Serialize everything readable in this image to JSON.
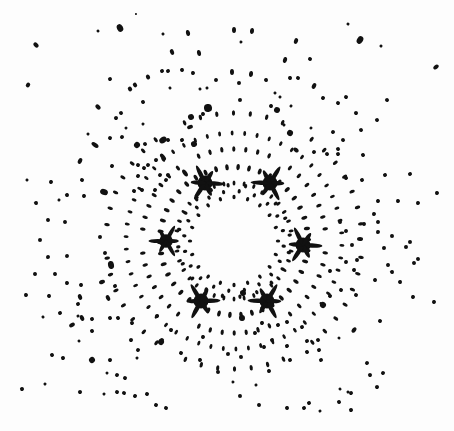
{
  "image": {
    "subject": "X-ray Laue diffraction pattern",
    "width": 454,
    "height": 431,
    "background": "#fdfdfd",
    "spot_color": "#111111",
    "center": [
      234,
      241
    ],
    "symmetry": 6
  },
  "stars": [
    {
      "x": 205,
      "y": 183,
      "r": 10
    },
    {
      "x": 270,
      "y": 183,
      "r": 10
    },
    {
      "x": 166,
      "y": 241,
      "r": 9
    },
    {
      "x": 303,
      "y": 245,
      "r": 10
    },
    {
      "x": 201,
      "y": 301,
      "r": 10
    },
    {
      "x": 267,
      "y": 301,
      "r": 10
    }
  ],
  "spots": [
    [
      120,
      28,
      3,
      4
    ],
    [
      136,
      14,
      1,
      1
    ],
    [
      98,
      31,
      1.5,
      1.5
    ],
    [
      36,
      45,
      2,
      3
    ],
    [
      28,
      85,
      2.5,
      2
    ],
    [
      188,
      33,
      2,
      3
    ],
    [
      163,
      34,
      1.5,
      1.5
    ],
    [
      172,
      52,
      2,
      3
    ],
    [
      199,
      53,
      2,
      3
    ],
    [
      162,
      71,
      2,
      2
    ],
    [
      168,
      71,
      2,
      2
    ],
    [
      182,
      70,
      2,
      2
    ],
    [
      193,
      73,
      2,
      2
    ],
    [
      148,
      77,
      2,
      2.5
    ],
    [
      110,
      79,
      2,
      2
    ],
    [
      130,
      89,
      2,
      2.5
    ],
    [
      135,
      85,
      2,
      2.5
    ],
    [
      216,
      80,
      2,
      2
    ],
    [
      170,
      88,
      1.5,
      1.5
    ],
    [
      200,
      89,
      1.5,
      1.5
    ],
    [
      207,
      88,
      1.5,
      1.5
    ],
    [
      98,
      107,
      2,
      3
    ],
    [
      143,
      102,
      2,
      2
    ],
    [
      121,
      113,
      2,
      2
    ],
    [
      116,
      118,
      2,
      2
    ],
    [
      126,
      128,
      1.5,
      1.5
    ],
    [
      143,
      124,
      1.5,
      1.5
    ],
    [
      190,
      127,
      3,
      2
    ],
    [
      208,
      108,
      4,
      4
    ],
    [
      203,
      114,
      2,
      2
    ],
    [
      191,
      117,
      3,
      3
    ],
    [
      88,
      134,
      1.5,
      1.5
    ],
    [
      110,
      138,
      2,
      2
    ],
    [
      95,
      145,
      2,
      4
    ],
    [
      122,
      137,
      2,
      2
    ],
    [
      137,
      145,
      3,
      3
    ],
    [
      145,
      144,
      2,
      2
    ],
    [
      163,
      140,
      4,
      3
    ],
    [
      168,
      140,
      2,
      2
    ],
    [
      182,
      140,
      2,
      2
    ],
    [
      194,
      144,
      3,
      3
    ],
    [
      80,
      161,
      3,
      2
    ],
    [
      112,
      166,
      2,
      2
    ],
    [
      148,
      165,
      2,
      2
    ],
    [
      138,
      165,
      2,
      2
    ],
    [
      156,
      160,
      2,
      2
    ],
    [
      163,
      157,
      2,
      4
    ],
    [
      27,
      180,
      1.5,
      1.5
    ],
    [
      51,
      182,
      2,
      2
    ],
    [
      82,
      180,
      2,
      2
    ],
    [
      104,
      192,
      3,
      4
    ],
    [
      138,
      176,
      2,
      2
    ],
    [
      144,
      168,
      2,
      2
    ],
    [
      160,
      175,
      2,
      2
    ],
    [
      168,
      175,
      2,
      2
    ],
    [
      185,
      173,
      2,
      4
    ],
    [
      36,
      203,
      2,
      2
    ],
    [
      59,
      200,
      1.5,
      1.5
    ],
    [
      67,
      195,
      2,
      2
    ],
    [
      84,
      196,
      2,
      2
    ],
    [
      134,
      191,
      2,
      2
    ],
    [
      142,
      190,
      2,
      2
    ],
    [
      155,
      190,
      2,
      2
    ],
    [
      166,
      180,
      2,
      2
    ],
    [
      234,
      30,
      2,
      3
    ],
    [
      252,
      31,
      2,
      3
    ],
    [
      241,
      42,
      1.5,
      1.5
    ],
    [
      296,
      41,
      2,
      3
    ],
    [
      348,
      24,
      1.5,
      1.5
    ],
    [
      360,
      40,
      3,
      4
    ],
    [
      381,
      46,
      1.5,
      1.5
    ],
    [
      436,
      67,
      2,
      3
    ],
    [
      285,
      60,
      2,
      3
    ],
    [
      310,
      59,
      2,
      2
    ],
    [
      232,
      72,
      2,
      3
    ],
    [
      251,
      74,
      2,
      3
    ],
    [
      266,
      80,
      2,
      2
    ],
    [
      290,
      78,
      2,
      2
    ],
    [
      298,
      78,
      2,
      2
    ],
    [
      314,
      86,
      2,
      3
    ],
    [
      323,
      98,
      2,
      2
    ],
    [
      346,
      97,
      2,
      2
    ],
    [
      338,
      103,
      2,
      2
    ],
    [
      387,
      100,
      2,
      2
    ],
    [
      356,
      113,
      2,
      2
    ],
    [
      377,
      120,
      2,
      2
    ],
    [
      239,
      83,
      2,
      2
    ],
    [
      275,
      93,
      1.5,
      1.5
    ],
    [
      280,
      97,
      1.5,
      1.5
    ],
    [
      240,
      100,
      2,
      2
    ],
    [
      271,
      106,
      2,
      2
    ],
    [
      277,
      110,
      3,
      3
    ],
    [
      291,
      106,
      1.5,
      1.5
    ],
    [
      284,
      125,
      1.5,
      1.5
    ],
    [
      290,
      133,
      3,
      3
    ],
    [
      311,
      128,
      1.5,
      1.5
    ],
    [
      333,
      132,
      2,
      2
    ],
    [
      343,
      140,
      2,
      2
    ],
    [
      338,
      149,
      2,
      2
    ],
    [
      361,
      130,
      2,
      2
    ],
    [
      363,
      155,
      2,
      2
    ],
    [
      385,
      175,
      2,
      2
    ],
    [
      410,
      174,
      2,
      2
    ],
    [
      437,
      193,
      2,
      2
    ],
    [
      296,
      150,
      3,
      2
    ],
    [
      314,
      152,
      2,
      2
    ],
    [
      327,
      154,
      2,
      2
    ],
    [
      338,
      154,
      2,
      2
    ],
    [
      346,
      178,
      2,
      2
    ],
    [
      362,
      180,
      2,
      2
    ],
    [
      378,
      201,
      2,
      2
    ],
    [
      398,
      201,
      2,
      2
    ],
    [
      418,
      203,
      2,
      2
    ],
    [
      48,
      220,
      2,
      2
    ],
    [
      65,
      222,
      2,
      2
    ],
    [
      40,
      240,
      2,
      2
    ],
    [
      48,
      257,
      2,
      2
    ],
    [
      67,
      256,
      2,
      2
    ],
    [
      35,
      274,
      2,
      2
    ],
    [
      55,
      274,
      2,
      2
    ],
    [
      67,
      283,
      2,
      2
    ],
    [
      81,
      285,
      2,
      2
    ],
    [
      26,
      295,
      2,
      2
    ],
    [
      49,
      296,
      2,
      2
    ],
    [
      80,
      297,
      3,
      2
    ],
    [
      108,
      298,
      3,
      2
    ],
    [
      115,
      286,
      2,
      2
    ],
    [
      111,
      265,
      4,
      3
    ],
    [
      102,
      282,
      2,
      3
    ],
    [
      100,
      237,
      2,
      2
    ],
    [
      105,
      253,
      2,
      2
    ],
    [
      78,
      304,
      2,
      2
    ],
    [
      60,
      313,
      2,
      2
    ],
    [
      82,
      318,
      3,
      2
    ],
    [
      110,
      318,
      2,
      2
    ],
    [
      118,
      318,
      2,
      2
    ],
    [
      43,
      317,
      1.5,
      1.5
    ],
    [
      79,
      341,
      1.5,
      1.5
    ],
    [
      78,
      316,
      1.5,
      1.5
    ],
    [
      92,
      319,
      2,
      2
    ],
    [
      92,
      331,
      2,
      2
    ],
    [
      72,
      325,
      2,
      3
    ],
    [
      92,
      360,
      3,
      3
    ],
    [
      63,
      358,
      2,
      2
    ],
    [
      45,
      384,
      1.5,
      1.5
    ],
    [
      52,
      355,
      2,
      2
    ],
    [
      22,
      389,
      2,
      2
    ],
    [
      80,
      392,
      2,
      2
    ],
    [
      104,
      394,
      1.5,
      1.5
    ],
    [
      107,
      373,
      1.5,
      1.5
    ],
    [
      117,
      375,
      2,
      2
    ],
    [
      110,
      360,
      2,
      2
    ],
    [
      125,
      378,
      2,
      2
    ],
    [
      117,
      392,
      2,
      2
    ],
    [
      124,
      393,
      2,
      2
    ],
    [
      135,
      396,
      2,
      2
    ],
    [
      147,
      394,
      2,
      2
    ],
    [
      156,
      405,
      2,
      2
    ],
    [
      166,
      408,
      2,
      2
    ],
    [
      137,
      358,
      1.5,
      1.5
    ],
    [
      131,
      340,
      2,
      2
    ],
    [
      138,
      350,
      2,
      2
    ],
    [
      132,
      323,
      2,
      2
    ],
    [
      162,
      340,
      2,
      2
    ],
    [
      171,
      330,
      2,
      2
    ],
    [
      157,
      316,
      2,
      2
    ],
    [
      161,
      342,
      3,
      3
    ],
    [
      181,
      353,
      2,
      2
    ],
    [
      200,
      360,
      2,
      2
    ],
    [
      203,
      337,
      2,
      2
    ],
    [
      218,
      372,
      2,
      2
    ],
    [
      228,
      354,
      2,
      2
    ],
    [
      233,
      382,
      1.5,
      1.5
    ],
    [
      240,
      396,
      2,
      2
    ],
    [
      256,
      385,
      1.5,
      1.5
    ],
    [
      259,
      405,
      2,
      2
    ],
    [
      287,
      408,
      2,
      2
    ],
    [
      304,
      408,
      2,
      2
    ],
    [
      309,
      403,
      2,
      2
    ],
    [
      320,
      411,
      1.5,
      1.5
    ],
    [
      351,
      410,
      2,
      2
    ],
    [
      377,
      387,
      2,
      2
    ],
    [
      339,
      402,
      2,
      2
    ],
    [
      351,
      393,
      2,
      2
    ],
    [
      383,
      373,
      2,
      2
    ],
    [
      348,
      392,
      1.5,
      1.5
    ],
    [
      370,
      375,
      2,
      2
    ],
    [
      367,
      363,
      2,
      2
    ],
    [
      340,
      389,
      1.5,
      1.5
    ],
    [
      321,
      360,
      2,
      2
    ],
    [
      319,
      350,
      2,
      2
    ],
    [
      307,
      352,
      2,
      2
    ],
    [
      307,
      341,
      2,
      2
    ],
    [
      290,
      360,
      2,
      2
    ],
    [
      269,
      371,
      2,
      2
    ],
    [
      287,
      346,
      2,
      2
    ],
    [
      272,
      340,
      2,
      2
    ],
    [
      264,
      347,
      2,
      2
    ],
    [
      255,
      333,
      2,
      2
    ],
    [
      241,
      357,
      2,
      2
    ],
    [
      242,
      318,
      3,
      3
    ],
    [
      243,
      293,
      3,
      3
    ],
    [
      262,
      323,
      2,
      2
    ],
    [
      278,
      325,
      2,
      2
    ],
    [
      287,
      322,
      2,
      2
    ],
    [
      302,
      327,
      2,
      2
    ],
    [
      318,
      340,
      2,
      2
    ],
    [
      339,
      338,
      1.5,
      1.5
    ],
    [
      354,
      330,
      3,
      2
    ],
    [
      380,
      321,
      2,
      2
    ],
    [
      400,
      282,
      2,
      2
    ],
    [
      414,
      263,
      2,
      2
    ],
    [
      392,
      272,
      2,
      2
    ],
    [
      388,
      265,
      2,
      2
    ],
    [
      410,
      242,
      2,
      2
    ],
    [
      418,
      259,
      2,
      2
    ],
    [
      406,
      247,
      2,
      2
    ],
    [
      384,
      248,
      2,
      2
    ],
    [
      378,
      232,
      2,
      2
    ],
    [
      392,
      236,
      2,
      2
    ],
    [
      378,
      222,
      2,
      2
    ],
    [
      374,
      214,
      2,
      2
    ],
    [
      413,
      297,
      2,
      2
    ],
    [
      434,
      302,
      2,
      2
    ],
    [
      356,
      295,
      2,
      2
    ],
    [
      375,
      280,
      2,
      2
    ],
    [
      354,
      270,
      2,
      2
    ],
    [
      346,
      262,
      2,
      2
    ],
    [
      341,
      290,
      2,
      2
    ],
    [
      330,
      296,
      2,
      2
    ],
    [
      323,
      305,
      3,
      3
    ],
    [
      330,
      271,
      2,
      2
    ],
    [
      352,
      245,
      2,
      2
    ],
    [
      357,
      260,
      2,
      2
    ],
    [
      360,
      239,
      2,
      3
    ],
    [
      364,
      224,
      2,
      2
    ],
    [
      340,
      222,
      2,
      2
    ],
    [
      346,
      231,
      2,
      2
    ]
  ],
  "rings": [
    {
      "r": 58,
      "n": 36,
      "size": 1.8
    },
    {
      "r": 74,
      "n": 42,
      "size": 2.2
    },
    {
      "r": 92,
      "n": 48,
      "size": 2
    },
    {
      "r": 108,
      "n": 54,
      "size": 1.8
    },
    {
      "r": 128,
      "n": 48,
      "size": 2
    }
  ]
}
